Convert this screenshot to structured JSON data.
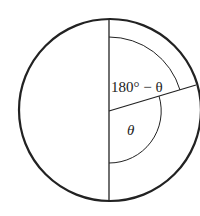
{
  "diagram": {
    "type": "circle-angle-diagram",
    "labels": {
      "upper_angle": "180° − θ",
      "lower_angle": "θ"
    },
    "colors": {
      "stroke": "#222222",
      "background": "#ffffff"
    }
  }
}
